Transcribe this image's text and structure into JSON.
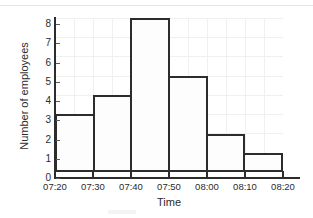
{
  "chart_data": {
    "type": "bar",
    "title": "",
    "xlabel": "Time",
    "ylabel": "Number of employees",
    "categories": [
      "07:20-07:30",
      "07:30-07:40",
      "07:40-07:50",
      "07:50-08:00",
      "08:00-08:10",
      "08:10-08:20"
    ],
    "values": [
      3,
      4,
      8,
      5,
      2,
      1
    ],
    "x_tick_labels": [
      "07:20",
      "07:30",
      "07:40",
      "07:50",
      "08:00",
      "08:10",
      "08:20"
    ],
    "y_tick_labels": [
      "0",
      "1",
      "2",
      "3",
      "4",
      "5",
      "6",
      "7",
      "8"
    ],
    "ylim": [
      0,
      8
    ],
    "xlim": [
      "07:20",
      "08:20"
    ],
    "bin_width_minutes": 10,
    "grid": true,
    "legend": false,
    "colors": {
      "bar_outline": "#2c2c2c",
      "bar_fill": "#fdfdfd",
      "axis": "#2c2c2c",
      "grid": "#f0f0f1",
      "text": "#2b2b2b",
      "top_rule": "#e3e4e6"
    }
  }
}
